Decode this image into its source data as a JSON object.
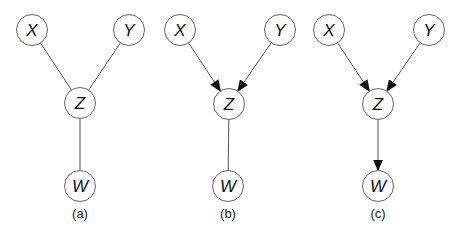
{
  "diagrams": [
    {
      "caption": "(a)",
      "nodes": [
        {
          "id": "X",
          "label": "X",
          "cx": 32,
          "cy": 30
        },
        {
          "id": "Y",
          "label": "Y",
          "cx": 129,
          "cy": 30
        },
        {
          "id": "Z",
          "label": "Z",
          "cx": 80,
          "cy": 103
        },
        {
          "id": "W",
          "label": "W",
          "cx": 80,
          "cy": 186
        }
      ],
      "edges": [
        {
          "from": "X",
          "to": "Z",
          "directed": false
        },
        {
          "from": "Y",
          "to": "Z",
          "directed": false
        },
        {
          "from": "Z",
          "to": "W",
          "directed": false
        }
      ],
      "caption_x": 80
    },
    {
      "caption": "(b)",
      "nodes": [
        {
          "id": "X",
          "label": "X",
          "cx": 180,
          "cy": 30
        },
        {
          "id": "Y",
          "label": "Y",
          "cx": 280,
          "cy": 30
        },
        {
          "id": "Z",
          "label": "Z",
          "cx": 229,
          "cy": 104
        },
        {
          "id": "W",
          "label": "W",
          "cx": 228,
          "cy": 186
        }
      ],
      "edges": [
        {
          "from": "X",
          "to": "Z",
          "directed": true
        },
        {
          "from": "Y",
          "to": "Z",
          "directed": true
        },
        {
          "from": "Z",
          "to": "W",
          "directed": false
        }
      ],
      "caption_x": 228
    },
    {
      "caption": "(c)",
      "nodes": [
        {
          "id": "X",
          "label": "X",
          "cx": 329,
          "cy": 30
        },
        {
          "id": "Y",
          "label": "Y",
          "cx": 429,
          "cy": 30
        },
        {
          "id": "Z",
          "label": "Z",
          "cx": 378,
          "cy": 104
        },
        {
          "id": "W",
          "label": "W",
          "cx": 378,
          "cy": 186
        }
      ],
      "edges": [
        {
          "from": "X",
          "to": "Z",
          "directed": true
        },
        {
          "from": "Y",
          "to": "Z",
          "directed": true
        },
        {
          "from": "Z",
          "to": "W",
          "directed": true
        }
      ],
      "caption_x": 378
    }
  ],
  "style": {
    "node_radius": 15.5,
    "edge_color": "#555555",
    "node_stroke": "#666666",
    "caption_y": 218
  }
}
